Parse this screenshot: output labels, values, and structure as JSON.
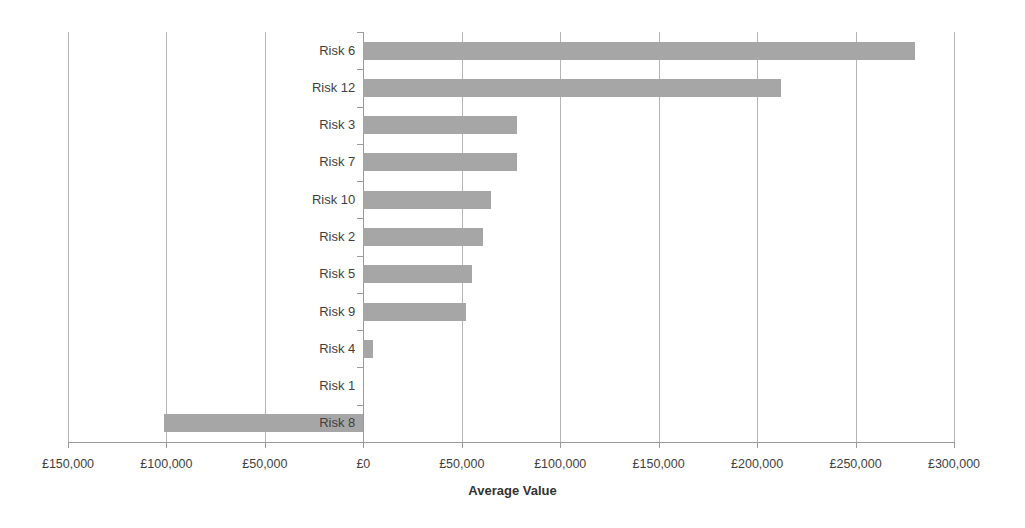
{
  "chart_data": {
    "type": "bar",
    "orientation": "horizontal",
    "title": "",
    "xlabel": "Average Value",
    "ylabel": "",
    "categories": [
      "Risk 6",
      "Risk 12",
      "Risk 3",
      "Risk 7",
      "Risk 10",
      "Risk 2",
      "Risk 5",
      "Risk 9",
      "Risk 4",
      "Risk 1",
      "Risk 8"
    ],
    "values": [
      280000,
      212000,
      78000,
      78000,
      65000,
      61000,
      55000,
      52000,
      5000,
      0,
      -101000
    ],
    "xlim": [
      -150000,
      300000
    ],
    "xticks": [
      -150000,
      -100000,
      -50000,
      0,
      50000,
      100000,
      150000,
      200000,
      250000,
      300000
    ],
    "xticklabels": [
      "£150,000",
      "£100,000",
      "£50,000",
      "£0",
      "£50,000",
      "£100,000",
      "£150,000",
      "£200,000",
      "£250,000",
      "£300,000"
    ],
    "grid": "vertical",
    "legend": "none",
    "series_color": "#a6a6a6",
    "gridline_color": "#b4b4b4",
    "axis_color": "#9a9a9a"
  },
  "axis": {
    "title": "Average Value"
  }
}
